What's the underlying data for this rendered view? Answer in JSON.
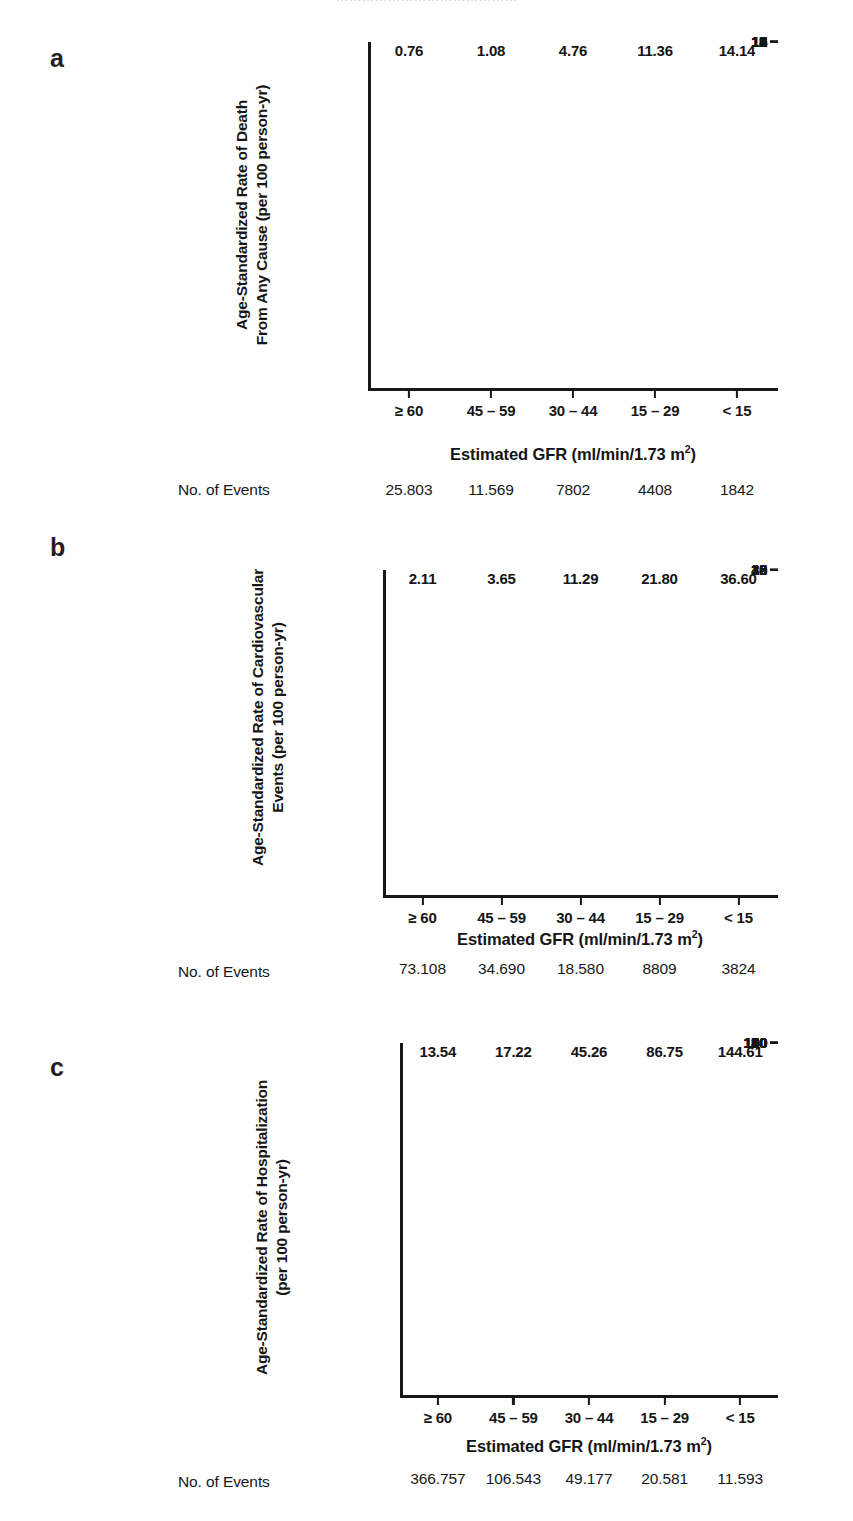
{
  "figure": {
    "cropped_header_text": "……………………………………",
    "shared": {
      "x_axis_title_main": "Estimated GFR (ml/min/1.73 m",
      "x_axis_title_sup": "2",
      "x_axis_title_close": ")",
      "events_row_label": "No. of Events",
      "categories": [
        "≥ 60",
        "45 – 59",
        "30 – 44",
        "15 – 29",
        "< 15"
      ],
      "bar_color": "#4d4d4d",
      "axis_color": "#181818"
    },
    "panels": [
      {
        "letter": "a",
        "y_title_line1": "Age-Standardized Rate of Death",
        "y_title_line2": "From Any Cause (per 100 person-yr)",
        "y_ticks": [
          "0",
          "1",
          "2",
          "3",
          "4",
          "5",
          "6",
          "7",
          "8",
          "9",
          "10",
          "11",
          "12",
          "13",
          "14",
          "15"
        ],
        "bar_labels": [
          "0.76",
          "1.08",
          "4.76",
          "11.36",
          "14.14"
        ],
        "events": [
          "25.803",
          "11.569",
          "7802",
          "4408",
          "1842"
        ]
      },
      {
        "letter": "b",
        "y_title_line1": "Age-Standardized Rate of Cardiovascular",
        "y_title_line2": "Events (per 100 person-yr)",
        "y_ticks": [
          "0",
          "2",
          "10",
          "15",
          "20",
          "25",
          "30",
          "35",
          "40"
        ],
        "bar_labels": [
          "2.11",
          "3.65",
          "11.29",
          "21.80",
          "36.60"
        ],
        "events": [
          "73.108",
          "34.690",
          "18.580",
          "8809",
          "3824"
        ]
      },
      {
        "letter": "c",
        "y_title_line1": "Age-Standardized Rate of Hospitalization",
        "y_title_line2": "(per 100 person-yr)",
        "y_ticks": [
          "0",
          "10",
          "20",
          "30",
          "40",
          "50",
          "60",
          "70",
          "80",
          "90",
          "100",
          "110",
          "120",
          "130",
          "140",
          "150"
        ],
        "bar_labels": [
          "13.54",
          "17.22",
          "45.26",
          "86.75",
          "144.61"
        ],
        "events": [
          "366.757",
          "106.543",
          "49.177",
          "20.581",
          "11.593"
        ]
      }
    ]
  },
  "chart_data": [
    {
      "type": "bar",
      "panel": "a",
      "title": "",
      "categories": [
        "≥ 60",
        "45 – 59",
        "30 – 44",
        "15 – 29",
        "< 15"
      ],
      "values": [
        0.76,
        1.08,
        4.76,
        11.36,
        14.14
      ],
      "data_labels": [
        "0.76",
        "1.08",
        "4.76",
        "11.36",
        "14.14"
      ],
      "xlabel": "Estimated GFR (ml/min/1.73 m2)",
      "ylabel": "Age-Standardized Rate of Death From Any Cause (per 100 person-yr)",
      "ylim": [
        0,
        15
      ],
      "ytick_values": [
        0,
        1,
        2,
        3,
        4,
        5,
        6,
        7,
        8,
        9,
        10,
        11,
        12,
        13,
        14,
        15
      ],
      "ytick_labels": [
        "0",
        "1",
        "2",
        "3",
        "4",
        "5",
        "6",
        "7",
        "8",
        "9",
        "10",
        "11",
        "12",
        "13",
        "14",
        "15"
      ],
      "annotations": {
        "row_label": "No. of Events",
        "row_values": [
          "25.803",
          "11.569",
          "7802",
          "4408",
          "1842"
        ]
      },
      "grid": false,
      "legend": "none",
      "bar_color": "#4d4d4d"
    },
    {
      "type": "bar",
      "panel": "b",
      "title": "",
      "categories": [
        "≥ 60",
        "45 – 59",
        "30 – 44",
        "15 – 29",
        "< 15"
      ],
      "values": [
        2.11,
        3.65,
        11.29,
        21.8,
        36.6
      ],
      "data_labels": [
        "2.11",
        "3.65",
        "11.29",
        "21.80",
        "36.60"
      ],
      "xlabel": "Estimated GFR (ml/min/1.73 m2)",
      "ylabel": "Age-Standardized Rate of Cardiovascular Events (per 100 person-yr)",
      "ylim": [
        0,
        40
      ],
      "ytick_values": [
        0,
        5,
        10,
        15,
        20,
        25,
        30,
        35,
        40
      ],
      "ytick_labels": [
        "0",
        "2",
        "10",
        "15",
        "20",
        "25",
        "30",
        "35",
        "40"
      ],
      "note": "the 5 gridline is printed as '2' in the source figure",
      "annotations": {
        "row_label": "No. of Events",
        "row_values": [
          "73.108",
          "34.690",
          "18.580",
          "8809",
          "3824"
        ]
      },
      "grid": false,
      "legend": "none",
      "bar_color": "#4d4d4d"
    },
    {
      "type": "bar",
      "panel": "c",
      "title": "",
      "categories": [
        "≥ 60",
        "45 – 59",
        "30 – 44",
        "15 – 29",
        "< 15"
      ],
      "values": [
        13.54,
        17.22,
        45.26,
        86.75,
        144.61
      ],
      "data_labels": [
        "13.54",
        "17.22",
        "45.26",
        "86.75",
        "144.61"
      ],
      "xlabel": "Estimated GFR (ml/min/1.73 m2)",
      "ylabel": "Age-Standardized Rate of Hospitalization (per 100 person-yr)",
      "ylim": [
        0,
        150
      ],
      "ytick_values": [
        0,
        10,
        20,
        30,
        40,
        50,
        60,
        70,
        80,
        90,
        100,
        110,
        120,
        130,
        140,
        150
      ],
      "ytick_labels": [
        "0",
        "10",
        "20",
        "30",
        "40",
        "50",
        "60",
        "70",
        "80",
        "90",
        "100",
        "110",
        "120",
        "130",
        "140",
        "150"
      ],
      "annotations": {
        "row_label": "No. of Events",
        "row_values": [
          "366.757",
          "106.543",
          "49.177",
          "20.581",
          "11.593"
        ]
      },
      "grid": false,
      "legend": "none",
      "bar_color": "#4d4d4d"
    }
  ]
}
